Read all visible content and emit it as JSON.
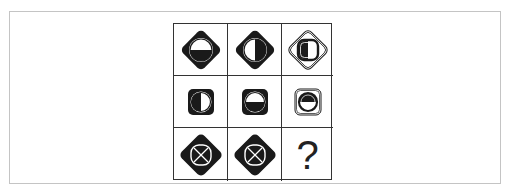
{
  "puzzle": {
    "title": "",
    "colors": {
      "ink": "#1a1a1a",
      "paper": "#ffffff",
      "frame": "#c4c4c4",
      "grid": "#333333"
    },
    "cells": [
      {
        "row": 1,
        "col": 1,
        "outer": "black-diamond",
        "inner": "white-ring-circle",
        "fill": "bottom-half-black"
      },
      {
        "row": 1,
        "col": 2,
        "outer": "black-diamond",
        "inner": "white-ring-circle",
        "fill": "right-half-black"
      },
      {
        "row": 1,
        "col": 3,
        "outer": "white-diamond-double-outline",
        "inner": "black-ring-rounded-square",
        "fill": "left-half-black"
      },
      {
        "row": 2,
        "col": 1,
        "outer": "black-rounded-square",
        "inner": "white-ring-circle",
        "fill": "left-half-black"
      },
      {
        "row": 2,
        "col": 2,
        "outer": "black-rounded-square",
        "inner": "white-ring-circle",
        "fill": "bottom-half-black"
      },
      {
        "row": 2,
        "col": 3,
        "outer": "white-rounded-square-double-outline",
        "inner": "black-ring-circle",
        "fill": "top-half-black"
      },
      {
        "row": 3,
        "col": 1,
        "outer": "black-diamond",
        "inner": "white-ring-rounded-square",
        "fill": "x-cross"
      },
      {
        "row": 3,
        "col": 2,
        "outer": "black-diamond",
        "inner": "white-ring-rounded-square",
        "fill": "x-cross"
      },
      {
        "row": 3,
        "col": 3,
        "outer": "none",
        "inner": "none",
        "fill": "unknown"
      }
    ],
    "missing_label": "?"
  }
}
